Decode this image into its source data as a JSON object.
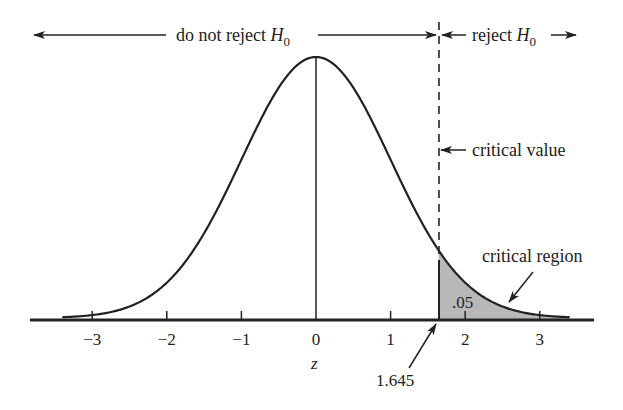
{
  "chart_data": {
    "type": "area",
    "title": "",
    "xlabel": "z",
    "ylabel": "",
    "distribution": "standard normal",
    "x_ticks": [
      -3,
      -2,
      -1,
      0,
      1,
      2,
      3
    ],
    "x_tick_labels": [
      "−3",
      "−2",
      "−1",
      "0",
      "1",
      "2",
      "3"
    ],
    "xlim": [
      -3.4,
      3.4
    ],
    "critical_value": 1.645,
    "critical_value_label": "1.645",
    "shaded_region": {
      "from": 1.645,
      "to": 3.4,
      "area": 0.05,
      "area_label": ".05"
    },
    "annotations": [
      {
        "text": "do not reject H0",
        "region": "left of critical value"
      },
      {
        "text": "reject H0",
        "region": "right of critical value"
      },
      {
        "text": "critical value",
        "points_to": "dashed line at z = 1.645"
      },
      {
        "text": "critical region",
        "points_to": "shaded tail"
      }
    ],
    "grid": false,
    "legend": null
  },
  "labels": {
    "do_not_reject": "do not reject ",
    "reject": "reject ",
    "h": "H",
    "sub0": "0",
    "critical_value": "critical value",
    "critical_region": "critical region",
    "area": ".05",
    "crit": "1.645",
    "z": "z",
    "ticks": [
      "−3",
      "−2",
      "−1",
      "0",
      "1",
      "2",
      "3"
    ]
  },
  "colors": {
    "ink": "#222222",
    "shade": "#b8b8b8"
  }
}
